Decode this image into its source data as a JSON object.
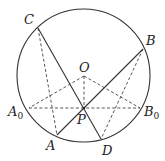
{
  "diagram": {
    "type": "geometry",
    "colors": {
      "line": "#333333",
      "dashed": "#444444",
      "text": "#222222",
      "background": "#ffffff"
    },
    "circle": {
      "center": "O",
      "cx": 83.5,
      "cy": 75.5,
      "r": 66.5
    },
    "points": {
      "C": {
        "label": "C",
        "x": 38,
        "y": 28
      },
      "B": {
        "label": "B",
        "x": 143,
        "y": 49
      },
      "O": {
        "label": "O",
        "x": 84,
        "y": 76
      },
      "A0": {
        "label": "A",
        "sub": "0",
        "x": 29,
        "y": 108
      },
      "B0": {
        "label": "B",
        "sub": "0",
        "x": 140,
        "y": 108
      },
      "P": {
        "label": "P",
        "x": 84,
        "y": 108
      },
      "A": {
        "label": "A",
        "x": 57,
        "y": 135
      },
      "D": {
        "label": "D",
        "x": 101,
        "y": 139
      }
    },
    "solid_segments": [
      [
        "C",
        "D"
      ],
      [
        "B",
        "A"
      ]
    ],
    "dashed_segments": [
      [
        "C",
        "A"
      ],
      [
        "B",
        "D"
      ],
      [
        "A0",
        "B0"
      ],
      [
        "O",
        "A0"
      ],
      [
        "O",
        "B0"
      ],
      [
        "O",
        "P"
      ]
    ]
  }
}
